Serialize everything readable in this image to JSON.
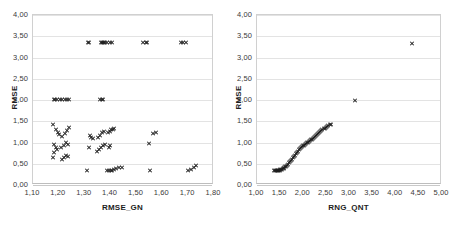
{
  "chart_data": [
    {
      "type": "scatter",
      "panel": "left",
      "title": "",
      "xlabel": "RMSE_GN",
      "ylabel": "RMSE",
      "xlim": [
        1.1,
        1.8
      ],
      "ylim": [
        0.0,
        4.0
      ],
      "xticks": [
        "1,10",
        "1,20",
        "1,30",
        "1,40",
        "1,50",
        "1,60",
        "1,70",
        "1,80"
      ],
      "xtickvals": [
        1.1,
        1.2,
        1.3,
        1.4,
        1.5,
        1.6,
        1.7,
        1.8
      ],
      "yticks": [
        "0,00",
        "0,50",
        "1,00",
        "1,50",
        "2,00",
        "2,50",
        "3,00",
        "3,50",
        "4,00"
      ],
      "ytickvals": [
        0.0,
        0.5,
        1.0,
        1.5,
        2.0,
        2.5,
        3.0,
        3.5,
        4.0
      ],
      "grid": "horizontal",
      "legend": "none",
      "marker": "x",
      "points": [
        [
          1.312,
          3.345
        ],
        [
          1.318,
          3.345
        ],
        [
          1.362,
          3.345
        ],
        [
          1.367,
          3.345
        ],
        [
          1.371,
          3.345
        ],
        [
          1.375,
          3.345
        ],
        [
          1.379,
          3.345
        ],
        [
          1.386,
          3.345
        ],
        [
          1.396,
          3.345
        ],
        [
          1.405,
          3.345
        ],
        [
          1.525,
          3.345
        ],
        [
          1.536,
          3.345
        ],
        [
          1.541,
          3.345
        ],
        [
          1.672,
          3.345
        ],
        [
          1.681,
          3.345
        ],
        [
          1.69,
          3.345
        ],
        [
          1.18,
          2.02
        ],
        [
          1.186,
          2.02
        ],
        [
          1.193,
          2.02
        ],
        [
          1.203,
          2.02
        ],
        [
          1.212,
          2.02
        ],
        [
          1.222,
          2.02
        ],
        [
          1.232,
          2.02
        ],
        [
          1.24,
          2.02
        ],
        [
          1.36,
          2.02
        ],
        [
          1.366,
          2.02
        ],
        [
          1.372,
          2.02
        ],
        [
          1.178,
          1.42
        ],
        [
          1.19,
          1.3
        ],
        [
          1.196,
          1.245
        ],
        [
          1.2,
          1.19
        ],
        [
          1.182,
          0.96
        ],
        [
          1.188,
          0.89
        ],
        [
          1.193,
          0.84
        ],
        [
          1.18,
          0.76
        ],
        [
          1.178,
          0.65
        ],
        [
          1.214,
          1.15
        ],
        [
          1.222,
          1.22
        ],
        [
          1.232,
          1.29
        ],
        [
          1.238,
          1.345
        ],
        [
          1.21,
          0.88
        ],
        [
          1.218,
          0.94
        ],
        [
          1.226,
          0.99
        ],
        [
          1.234,
          0.96
        ],
        [
          1.212,
          0.6
        ],
        [
          1.22,
          0.65
        ],
        [
          1.228,
          0.7
        ],
        [
          1.236,
          0.66
        ],
        [
          1.32,
          1.175
        ],
        [
          1.326,
          1.125
        ],
        [
          1.332,
          1.085
        ],
        [
          1.316,
          0.88
        ],
        [
          1.352,
          1.12
        ],
        [
          1.36,
          1.175
        ],
        [
          1.368,
          1.23
        ],
        [
          1.374,
          1.255
        ],
        [
          1.356,
          0.83
        ],
        [
          1.362,
          0.88
        ],
        [
          1.37,
          0.93
        ],
        [
          1.378,
          0.96
        ],
        [
          1.348,
          0.79
        ],
        [
          1.39,
          1.23
        ],
        [
          1.396,
          1.265
        ],
        [
          1.402,
          1.3
        ],
        [
          1.408,
          1.315
        ],
        [
          1.414,
          1.325
        ],
        [
          1.392,
          0.88
        ],
        [
          1.398,
          0.93
        ],
        [
          1.566,
          1.215
        ],
        [
          1.574,
          1.24
        ],
        [
          1.548,
          0.985
        ],
        [
          1.31,
          0.345
        ],
        [
          1.388,
          0.34
        ],
        [
          1.394,
          0.345
        ],
        [
          1.4,
          0.35
        ],
        [
          1.406,
          0.345
        ],
        [
          1.412,
          0.355
        ],
        [
          1.422,
          0.39
        ],
        [
          1.432,
          0.405
        ],
        [
          1.446,
          0.42
        ],
        [
          1.552,
          0.345
        ],
        [
          1.7,
          0.33
        ],
        [
          1.712,
          0.375
        ],
        [
          1.722,
          0.42
        ],
        [
          1.73,
          0.455
        ]
      ]
    },
    {
      "type": "scatter",
      "panel": "right",
      "title": "",
      "xlabel": "RNG_QNT",
      "ylabel": "RMSE",
      "xlim": [
        1.0,
        5.0
      ],
      "ylim": [
        0.0,
        4.0
      ],
      "xticks": [
        "1,00",
        "1,50",
        "2,00",
        "2,50",
        "3,00",
        "3,50",
        "4,00",
        "4,50",
        "5,00"
      ],
      "xtickvals": [
        1.0,
        1.5,
        2.0,
        2.5,
        3.0,
        3.5,
        4.0,
        4.5,
        5.0
      ],
      "yticks": [
        "0,00",
        "0,50",
        "1,00",
        "1,50",
        "2,00",
        "2,50",
        "3,00",
        "3,50",
        "4,00"
      ],
      "ytickvals": [
        0.0,
        0.5,
        1.0,
        1.5,
        2.0,
        2.5,
        3.0,
        3.5,
        4.0
      ],
      "grid": "horizontal",
      "legend": "none",
      "marker": "x",
      "points": [
        [
          1.375,
          0.345
        ],
        [
          1.395,
          0.34
        ],
        [
          1.415,
          0.335
        ],
        [
          1.432,
          0.34
        ],
        [
          1.448,
          0.345
        ],
        [
          1.462,
          0.345
        ],
        [
          1.478,
          0.35
        ],
        [
          1.492,
          0.35
        ],
        [
          1.508,
          0.355
        ],
        [
          1.522,
          0.36
        ],
        [
          1.54,
          0.37
        ],
        [
          1.558,
          0.382
        ],
        [
          1.576,
          0.395
        ],
        [
          1.594,
          0.41
        ],
        [
          1.612,
          0.425
        ],
        [
          1.632,
          0.445
        ],
        [
          1.652,
          0.468
        ],
        [
          1.672,
          0.492
        ],
        [
          1.692,
          0.518
        ],
        [
          1.712,
          0.545
        ],
        [
          1.734,
          0.575
        ],
        [
          1.756,
          0.608
        ],
        [
          1.778,
          0.64
        ],
        [
          1.8,
          0.672
        ],
        [
          1.822,
          0.705
        ],
        [
          1.844,
          0.738
        ],
        [
          1.866,
          0.77
        ],
        [
          1.888,
          0.8
        ],
        [
          1.91,
          0.828
        ],
        [
          1.932,
          0.855
        ],
        [
          1.954,
          0.88
        ],
        [
          1.976,
          0.902
        ],
        [
          1.998,
          0.922
        ],
        [
          2.02,
          0.94
        ],
        [
          2.042,
          0.958
        ],
        [
          2.064,
          0.975
        ],
        [
          2.086,
          0.992
        ],
        [
          2.108,
          1.008
        ],
        [
          2.13,
          1.025
        ],
        [
          2.152,
          1.042
        ],
        [
          2.174,
          1.06
        ],
        [
          2.196,
          1.078
        ],
        [
          2.218,
          1.098
        ],
        [
          2.24,
          1.118
        ],
        [
          2.262,
          1.138
        ],
        [
          2.284,
          1.16
        ],
        [
          2.306,
          1.182
        ],
        [
          2.328,
          1.205
        ],
        [
          2.35,
          1.228
        ],
        [
          2.372,
          1.25
        ],
        [
          2.394,
          1.272
        ],
        [
          2.416,
          1.295
        ],
        [
          2.44,
          1.318
        ],
        [
          2.464,
          1.34
        ],
        [
          2.488,
          1.36
        ],
        [
          2.512,
          1.378
        ],
        [
          2.54,
          1.398
        ],
        [
          2.568,
          1.412
        ],
        [
          2.596,
          1.425
        ],
        [
          3.12,
          2.0
        ],
        [
          4.36,
          3.33
        ]
      ]
    }
  ]
}
